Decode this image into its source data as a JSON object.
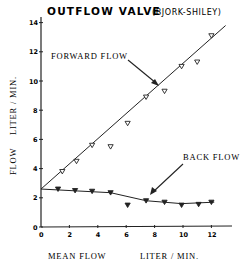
{
  "chart_data": {
    "type": "line",
    "title": "OUTFLOW VALVE",
    "subtitle": "(BJORK-SHILEY)",
    "xlabel": "MEAN FLOW",
    "xlabel_unit": "LITER / MIN.",
    "ylabel": "FLOW",
    "ylabel_unit": "LITER / MIN.",
    "xlim": [
      0,
      14
    ],
    "ylim": [
      0,
      14
    ],
    "xticks": [
      0,
      2,
      4,
      6,
      8,
      10,
      12
    ],
    "yticks": [
      0,
      2,
      4,
      6,
      8,
      10,
      12,
      14
    ],
    "grid": false,
    "series": [
      {
        "name": "FORWARD FLOW",
        "marker": "open-triangle-down",
        "points": [
          [
            1.5,
            3.8
          ],
          [
            2.5,
            4.5
          ],
          [
            3.6,
            5.6
          ],
          [
            4.9,
            5.5
          ],
          [
            6.1,
            7.1
          ],
          [
            7.4,
            8.9
          ],
          [
            8.7,
            9.3
          ],
          [
            9.9,
            11.0
          ],
          [
            11.0,
            11.3
          ],
          [
            12.0,
            13.1
          ]
        ],
        "fit_line": [
          [
            0,
            2.6
          ],
          [
            13.0,
            13.8
          ]
        ],
        "annotation": "FORWARD FLOW"
      },
      {
        "name": "BACK FLOW",
        "marker": "filled-triangle-down",
        "points": [
          [
            1.2,
            2.6
          ],
          [
            2.4,
            2.5
          ],
          [
            3.6,
            2.45
          ],
          [
            4.9,
            2.35
          ],
          [
            6.1,
            1.5
          ],
          [
            7.4,
            1.8
          ],
          [
            8.7,
            1.7
          ],
          [
            9.9,
            1.5
          ],
          [
            11.1,
            1.55
          ],
          [
            12.0,
            1.7
          ]
        ],
        "fit_line": [
          [
            0,
            2.6
          ],
          [
            4.9,
            2.35
          ],
          [
            7.4,
            1.8
          ],
          [
            9.9,
            1.6
          ],
          [
            12.2,
            1.7
          ]
        ],
        "annotation": "BACK FLOW"
      }
    ]
  }
}
